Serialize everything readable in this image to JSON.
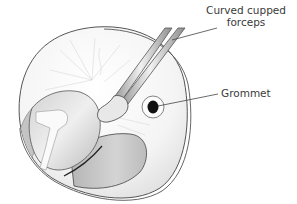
{
  "figure": {
    "labels": {
      "forceps_line1": "Curved cupped",
      "forceps_line2": "forceps",
      "grommet": "Grommet"
    },
    "colors": {
      "background": "#ffffff",
      "outline": "#555555",
      "tissue_light": "#e6e6e6",
      "tissue_mid": "#c8c8c8",
      "tissue_dark": "#a9a9a9",
      "grommet_center": "#111111",
      "text": "#3a3a3a"
    }
  }
}
